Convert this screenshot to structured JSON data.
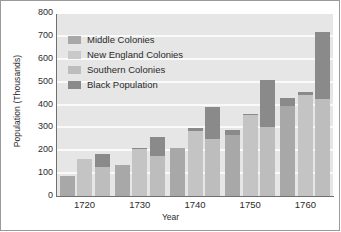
{
  "chart_data": {
    "type": "bar",
    "title": "",
    "xlabel": "Year",
    "ylabel": "Population (Thousands)",
    "categories": [
      "1720",
      "1730",
      "1740",
      "1750",
      "1760"
    ],
    "ylim": [
      0,
      800
    ],
    "yticks": [
      0,
      100,
      200,
      300,
      400,
      500,
      600,
      700,
      800
    ],
    "grid": true,
    "legend_position": "upper-left-inside",
    "stacked": true,
    "series": [
      {
        "name": "Middle Colonies",
        "color": "#a8a8a8",
        "values": [
          93,
          138,
          215,
          270,
          398
        ]
      },
      {
        "name": "New England Colonies",
        "color": "#c4c4c4",
        "values": [
          165,
          208,
          290,
          358,
          445
        ]
      },
      {
        "name": "Southern Colonies",
        "color": "#bdbdbd",
        "values": [
          130,
          180,
          255,
          305,
          430
        ]
      },
      {
        "name": "Black Population",
        "color": "#8a8a8a",
        "values_on_middle": [
          0,
          0,
          0,
          25,
          33
        ],
        "values_on_new_england": [
          0,
          5,
          10,
          5,
          15
        ],
        "values_on_southern": [
          57,
          82,
          140,
          208,
          292
        ]
      }
    ],
    "bar_totals": {
      "1720": {
        "middle": 93,
        "new_england": 165,
        "southern_total": 187
      },
      "1730": {
        "middle": 138,
        "new_england": 213,
        "southern_total": 262
      },
      "1740": {
        "middle": 215,
        "new_england": 300,
        "southern_total": 395
      },
      "1750": {
        "middle": 295,
        "new_england": 363,
        "southern_total": 513
      },
      "1760": {
        "middle": 431,
        "new_england": 460,
        "southern_total": 722
      }
    }
  },
  "legend": {
    "items": [
      {
        "label": "Middle Colonies",
        "color": "#a8a8a8"
      },
      {
        "label": "New England Colonies",
        "color": "#c9c9c9"
      },
      {
        "label": "Southern Colonies",
        "color": "#bdbdbd"
      },
      {
        "label": "Black Population",
        "color": "#8a8a8a"
      }
    ]
  },
  "axes": {
    "y_title": "Population (Thousands)",
    "x_title": "Year",
    "y_ticks": [
      "800",
      "700",
      "600",
      "500",
      "400",
      "300",
      "200",
      "100",
      "0"
    ],
    "x_ticks": [
      "1720",
      "1730",
      "1740",
      "1750",
      "1760"
    ]
  },
  "colors": {
    "plot_background": "#e6e6e6",
    "gridline": "#fafafa",
    "axis": "#6f6f6f",
    "text": "#2b2b2b",
    "frame": "#9a9a9a"
  }
}
